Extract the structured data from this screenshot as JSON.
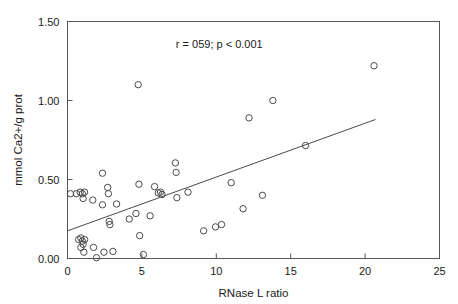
{
  "chart_data": {
    "type": "scatter",
    "title": "",
    "xlabel": "RNase L ratio",
    "ylabel": "mmol Ca2+/g prot",
    "xlim": [
      0,
      25
    ],
    "ylim": [
      0.0,
      1.5
    ],
    "xticks": [
      "0",
      "5",
      "10",
      "15",
      "20",
      "25"
    ],
    "xtick_values": [
      0,
      5,
      10,
      15,
      20,
      25
    ],
    "yticks": [
      "0.00",
      "0.50",
      "1.00",
      "1.50"
    ],
    "ytick_values": [
      0.0,
      0.5,
      1.0,
      1.5
    ],
    "grid": false,
    "legend": false,
    "annotation": "r = 059; p < 0.001",
    "annotation_x": 10.2,
    "annotation_y": 1.33,
    "marker": "open-circle",
    "marker_color": "#4a4a4a",
    "points": [
      [
        0.2,
        0.41
      ],
      [
        0.6,
        0.41
      ],
      [
        0.85,
        0.42
      ],
      [
        1.0,
        0.41
      ],
      [
        1.15,
        0.42
      ],
      [
        1.05,
        0.38
      ],
      [
        0.75,
        0.12
      ],
      [
        0.9,
        0.13
      ],
      [
        1.0,
        0.11
      ],
      [
        1.05,
        0.09
      ],
      [
        1.15,
        0.12
      ],
      [
        0.9,
        0.07
      ],
      [
        1.1,
        0.04
      ],
      [
        1.7,
        0.37
      ],
      [
        1.75,
        0.07
      ],
      [
        1.95,
        0.005
      ],
      [
        2.35,
        0.54
      ],
      [
        2.35,
        0.34
      ],
      [
        2.45,
        0.04
      ],
      [
        2.7,
        0.45
      ],
      [
        2.75,
        0.41
      ],
      [
        2.8,
        0.235
      ],
      [
        2.85,
        0.215
      ],
      [
        3.05,
        0.045
      ],
      [
        3.3,
        0.345
      ],
      [
        4.15,
        0.25
      ],
      [
        4.6,
        0.285
      ],
      [
        4.75,
        1.1
      ],
      [
        4.8,
        0.47
      ],
      [
        4.85,
        0.145
      ],
      [
        5.1,
        0.025
      ],
      [
        5.55,
        0.27
      ],
      [
        5.85,
        0.455
      ],
      [
        6.1,
        0.415
      ],
      [
        6.25,
        0.42
      ],
      [
        6.35,
        0.405
      ],
      [
        7.25,
        0.605
      ],
      [
        7.3,
        0.545
      ],
      [
        7.35,
        0.385
      ],
      [
        8.1,
        0.42
      ],
      [
        9.15,
        0.175
      ],
      [
        9.95,
        0.2
      ],
      [
        10.35,
        0.215
      ],
      [
        11.0,
        0.48
      ],
      [
        11.8,
        0.315
      ],
      [
        12.2,
        0.89
      ],
      [
        13.1,
        0.4
      ],
      [
        13.8,
        1.0
      ],
      [
        16.0,
        0.715
      ],
      [
        20.6,
        1.22
      ]
    ],
    "regression_line": {
      "x_start": 0.0,
      "y_start": 0.175,
      "x_end": 20.7,
      "y_end": 0.88
    }
  }
}
